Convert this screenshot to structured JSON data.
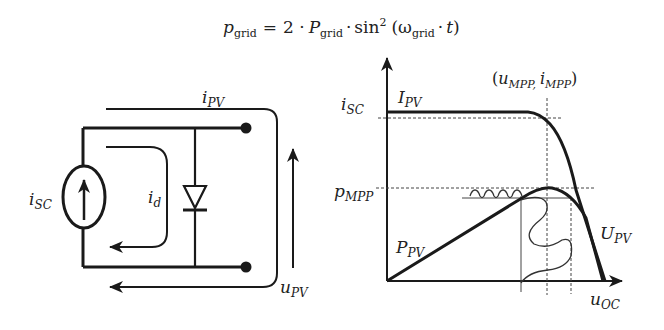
{
  "equation": {
    "lhs_symbol": "p",
    "lhs_sub": "grid",
    "equals": "=",
    "coef": "2 ·",
    "P_symbol": "P",
    "P_sub": "grid",
    "dot1": "·",
    "sin": "sin",
    "sin_sup": "2",
    "open": "(",
    "omega": "ω",
    "omega_sub": "grid",
    "dot2": "·",
    "t": "t",
    "close": ")"
  },
  "circuit": {
    "i_pv": {
      "sym": "i",
      "sub": "PV"
    },
    "i_sc": {
      "sym": "i",
      "sub": "SC"
    },
    "i_d": {
      "sym": "i",
      "sub": "d"
    },
    "u_pv": {
      "sym": "u",
      "sub": "PV"
    }
  },
  "graph": {
    "i_sc": {
      "sym": "i",
      "sub": "SC"
    },
    "I_pv": {
      "sym": "I",
      "sub": "PV"
    },
    "p_mpp": {
      "sym": "p",
      "sub": "MPP"
    },
    "P_pv": {
      "sym": "P",
      "sub": "PV"
    },
    "U_pv": {
      "sym": "U",
      "sub": "PV"
    },
    "u_oc": {
      "sym": "u",
      "sub": "OC"
    },
    "mpp_point": {
      "open": "(",
      "u": "u",
      "u_sub": "MPP,",
      "i": "i",
      "i_sub": "MPP",
      "close": ")"
    }
  },
  "colors": {
    "stroke": "#1a1a1a",
    "dashed": "#444444",
    "background": "#ffffff"
  }
}
